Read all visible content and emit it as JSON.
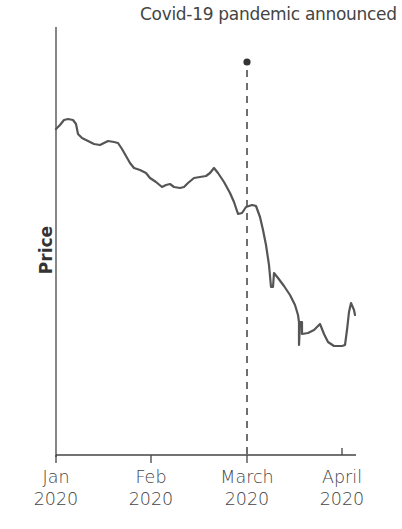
{
  "chart_data": {
    "type": "line",
    "title": "",
    "xlabel": "",
    "ylabel": "Price",
    "x_ticks": [
      {
        "label_line1": "Jan",
        "label_line2": "2020"
      },
      {
        "label_line1": "Feb",
        "label_line2": "2020"
      },
      {
        "label_line1": "March",
        "label_line2": "2020"
      },
      {
        "label_line1": "April",
        "label_line2": "2020"
      }
    ],
    "y_ticks": [],
    "grid": false,
    "legend": null,
    "annotation": {
      "text": "Covid-19 pandemic announced",
      "x": "March 2020",
      "style": "dashed vertical line with dot marker"
    },
    "series": [
      {
        "name": "Price",
        "color": "#555555",
        "points_pixel": [
          [
            56,
            129
          ],
          [
            60,
            125
          ],
          [
            64,
            120
          ],
          [
            68,
            119
          ],
          [
            73,
            120
          ],
          [
            76,
            124
          ],
          [
            78,
            134
          ],
          [
            82,
            138
          ],
          [
            88,
            141
          ],
          [
            94,
            144
          ],
          [
            100,
            145
          ],
          [
            104,
            143
          ],
          [
            108,
            141
          ],
          [
            114,
            142
          ],
          [
            118,
            143
          ],
          [
            122,
            149
          ],
          [
            126,
            156
          ],
          [
            130,
            163
          ],
          [
            134,
            168
          ],
          [
            140,
            170
          ],
          [
            146,
            173
          ],
          [
            150,
            178
          ],
          [
            156,
            182
          ],
          [
            162,
            187
          ],
          [
            166,
            185
          ],
          [
            170,
            184
          ],
          [
            174,
            187
          ],
          [
            180,
            188
          ],
          [
            184,
            187
          ],
          [
            188,
            183
          ],
          [
            194,
            178
          ],
          [
            200,
            177
          ],
          [
            206,
            176
          ],
          [
            210,
            173
          ],
          [
            214,
            168
          ],
          [
            218,
            173
          ],
          [
            224,
            182
          ],
          [
            230,
            193
          ],
          [
            234,
            202
          ],
          [
            238,
            214
          ],
          [
            242,
            213
          ],
          [
            246,
            207
          ],
          [
            252,
            205
          ],
          [
            256,
            206
          ],
          [
            260,
            217
          ],
          [
            263,
            230
          ],
          [
            266,
            245
          ],
          [
            269,
            265
          ],
          [
            271,
            287
          ],
          [
            273,
            287
          ],
          [
            274,
            273
          ],
          [
            278,
            278
          ],
          [
            284,
            286
          ],
          [
            290,
            295
          ],
          [
            295,
            305
          ],
          [
            298,
            315
          ],
          [
            299,
            322
          ],
          [
            299,
            345
          ],
          [
            300,
            322
          ],
          [
            302,
            322
          ],
          [
            302,
            334
          ],
          [
            308,
            333
          ],
          [
            314,
            330
          ],
          [
            320,
            324
          ],
          [
            324,
            334
          ],
          [
            328,
            342
          ],
          [
            334,
            346
          ],
          [
            342,
            346
          ],
          [
            345,
            345
          ],
          [
            347,
            330
          ],
          [
            349,
            312
          ],
          [
            351,
            303
          ],
          [
            354,
            310
          ],
          [
            355,
            315
          ]
        ],
        "note": "Values relative: starts high in early Jan, gradual decline through Feb, small rebound late Feb, sharp fall after March announcement, bottoming late March, slight recovery in early April."
      }
    ],
    "xlim": [
      "Jan 2020",
      "mid-April 2020"
    ],
    "ylim": null
  },
  "colors": {
    "line": "#555555",
    "axis": "#444444",
    "text": "#444444",
    "background": "#ffffff"
  }
}
